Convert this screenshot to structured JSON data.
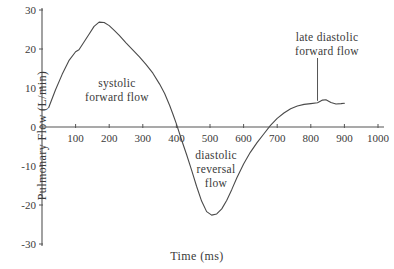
{
  "chart_data": {
    "type": "line",
    "title": "",
    "xlabel": "Time (ms)",
    "ylabel": "Pulmonary Flow (L/min)",
    "xlim": [
      0,
      1000
    ],
    "ylim": [
      -30,
      30
    ],
    "xticks": [
      100,
      200,
      300,
      400,
      500,
      600,
      700,
      800,
      900,
      1000
    ],
    "yticks": [
      30,
      20,
      10,
      0,
      -10,
      -20,
      -30
    ],
    "grid": false,
    "legend": "none",
    "series": [
      {
        "name": "pulmonary venous flow",
        "x": [
          20,
          40,
          60,
          80,
          100,
          110,
          125,
          140,
          155,
          170,
          185,
          200,
          215,
          230,
          250,
          270,
          290,
          310,
          330,
          350,
          365,
          380,
          390,
          400,
          415,
          430,
          445,
          460,
          475,
          490,
          505,
          520,
          535,
          550,
          565,
          580,
          600,
          620,
          640,
          660,
          680,
          700,
          720,
          740,
          760,
          780,
          800,
          820,
          835,
          845,
          860,
          875,
          890,
          900
        ],
        "y": [
          5.0,
          9.5,
          13.5,
          17.0,
          19.3,
          19.8,
          21.8,
          23.8,
          25.8,
          26.9,
          26.8,
          26.0,
          24.8,
          23.5,
          21.6,
          19.8,
          18.0,
          16.0,
          13.8,
          11.0,
          8.6,
          5.5,
          3.2,
          0.8,
          -3.2,
          -7.0,
          -11.0,
          -15.2,
          -19.0,
          -21.7,
          -22.6,
          -22.3,
          -21.0,
          -18.8,
          -16.0,
          -13.0,
          -9.5,
          -6.5,
          -4.0,
          -1.8,
          0.4,
          2.2,
          3.6,
          4.7,
          5.4,
          5.8,
          6.0,
          6.2,
          6.9,
          7.0,
          6.3,
          5.9,
          6.0,
          6.1
        ]
      }
    ],
    "annotations": [
      {
        "id": "systolic",
        "text_line1": "systolic",
        "text_line2": "forward flow",
        "x": 200,
        "y": 12
      },
      {
        "id": "diastolic",
        "text_line1": "diastolic",
        "text_line2": "reversal",
        "text_line3": "flow",
        "x": 500,
        "y": -7
      },
      {
        "id": "late-diastolic",
        "text_line1": "late diastolic",
        "text_line2": "forward flow",
        "x": 820,
        "y": 22,
        "leader_line": true
      }
    ]
  },
  "axes": {
    "y_title": "Pulmonary Flow (L/min)",
    "x_title": "Time (ms)",
    "y_tick_labels": [
      "30",
      "20",
      "10",
      "0",
      "-10",
      "-20",
      "-30"
    ],
    "x_tick_labels": [
      "100",
      "200",
      "300",
      "400",
      "500",
      "600",
      "700",
      "800",
      "900",
      "1000"
    ]
  },
  "annotations": {
    "systolic": {
      "line1": "systolic",
      "line2": "forward flow"
    },
    "diastolic": {
      "line1": "diastolic",
      "line2": "reversal",
      "line3": "flow"
    },
    "late": {
      "line1": "late diastolic",
      "line2": "forward flow"
    }
  },
  "colors": {
    "curve": "#4a4a4a",
    "axis": "#555555",
    "text": "#3a3a3a",
    "background": "#ffffff"
  }
}
